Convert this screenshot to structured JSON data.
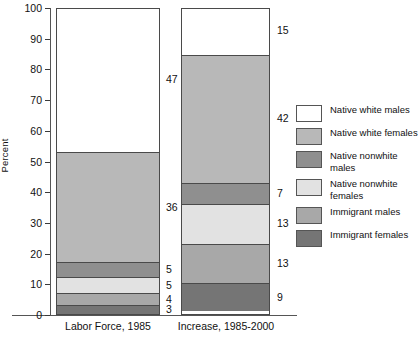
{
  "chart_data": {
    "type": "bar",
    "subtype": "stacked-100-percent",
    "title": "",
    "xlabel": "",
    "ylabel": "Percent",
    "ylim": [
      0,
      100
    ],
    "yticks": [
      100,
      90,
      80,
      70,
      60,
      50,
      40,
      30,
      20,
      10,
      0
    ],
    "grid": false,
    "legend_position": "right",
    "categories": [
      "Labor Force, 1985",
      "Increase, 1985-2000"
    ],
    "series": [
      {
        "name": "Native white males",
        "color": "#ffffff",
        "values": [
          47,
          15
        ]
      },
      {
        "name": "Native white females",
        "color": "#b8b8b8",
        "values": [
          36,
          42
        ]
      },
      {
        "name": "Native nonwhite males",
        "color": "#8f8f8f",
        "values": [
          5,
          7
        ]
      },
      {
        "name": "Native nonwhite females",
        "color": "#e2e2e2",
        "values": [
          5,
          13
        ]
      },
      {
        "name": "Immigrant males",
        "color": "#a8a8a8",
        "values": [
          4,
          13
        ]
      },
      {
        "name": "Immigrant females",
        "color": "#757575",
        "values": [
          3,
          9
        ]
      }
    ]
  },
  "axes": {
    "y_title": "Percent",
    "y_ticks": [
      "100",
      "90",
      "80",
      "70",
      "60",
      "50",
      "40",
      "30",
      "20",
      "10",
      "0"
    ],
    "x_labels": [
      "Labor Force, 1985",
      "Increase, 1985-2000"
    ]
  },
  "bars": {
    "labor": {
      "name": "Labor Force, 1985",
      "segments": [
        {
          "label": "47",
          "value": 47,
          "color": "#ffffff",
          "series": "Native white males"
        },
        {
          "label": "36",
          "value": 36,
          "color": "#b8b8b8",
          "series": "Native white females"
        },
        {
          "label": "5",
          "value": 5,
          "color": "#8f8f8f",
          "series": "Native nonwhite males"
        },
        {
          "label": "5",
          "value": 5,
          "color": "#e2e2e2",
          "series": "Native nonwhite females"
        },
        {
          "label": "4",
          "value": 4,
          "color": "#a8a8a8",
          "series": "Immigrant males"
        },
        {
          "label": "3",
          "value": 3,
          "color": "#757575",
          "series": "Immigrant females"
        }
      ]
    },
    "increase": {
      "name": "Increase, 1985-2000",
      "segments": [
        {
          "label": "15",
          "value": 15,
          "color": "#ffffff",
          "series": "Native white males"
        },
        {
          "label": "42",
          "value": 42,
          "color": "#b8b8b8",
          "series": "Native white females"
        },
        {
          "label": "7",
          "value": 7,
          "color": "#8f8f8f",
          "series": "Native nonwhite males"
        },
        {
          "label": "13",
          "value": 13,
          "color": "#e2e2e2",
          "series": "Native nonwhite females"
        },
        {
          "label": "13",
          "value": 13,
          "color": "#a8a8a8",
          "series": "Immigrant males"
        },
        {
          "label": "9",
          "value": 9,
          "color": "#757575",
          "series": "Immigrant females"
        }
      ]
    }
  },
  "legend": {
    "items": [
      {
        "label": "Native white males",
        "color": "#ffffff"
      },
      {
        "label": "Native white females",
        "color": "#b8b8b8"
      },
      {
        "label": "Native nonwhite males",
        "color": "#8f8f8f"
      },
      {
        "label": "Native nonwhite females",
        "color": "#e2e2e2"
      },
      {
        "label": "Immigrant males",
        "color": "#a8a8a8"
      },
      {
        "label": "Immigrant females",
        "color": "#757575"
      }
    ]
  }
}
